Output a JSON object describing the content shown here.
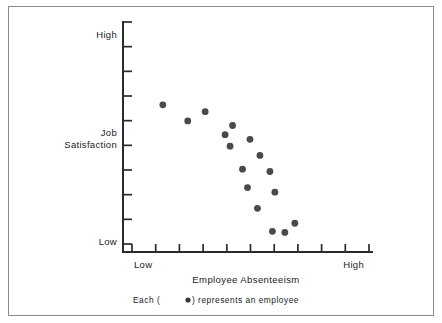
{
  "chart_data": {
    "type": "scatter",
    "title": "",
    "xlabel": "Employee Absenteeism",
    "ylabel": "Job Satisfaction",
    "xlim": [
      0,
      10
    ],
    "ylim": [
      0,
      10
    ],
    "grid": false,
    "legend": null,
    "x_tick_labels": {
      "low": "Low",
      "high": "High"
    },
    "y_tick_labels": {
      "low": "Low",
      "high": "High"
    },
    "x_tick_count": 11,
    "y_tick_count": 10,
    "caption": "Each ( ● ) represents an employee",
    "caption_prefix": "Each (",
    "caption_marker": "●",
    "caption_suffix": ") represents an employee",
    "point_count": 16,
    "points": [
      {
        "x": 1.6,
        "y": 6.4
      },
      {
        "x": 2.6,
        "y": 5.7
      },
      {
        "x": 3.3,
        "y": 6.1
      },
      {
        "x": 4.1,
        "y": 5.1
      },
      {
        "x": 4.4,
        "y": 5.5
      },
      {
        "x": 4.3,
        "y": 4.6
      },
      {
        "x": 5.1,
        "y": 4.9
      },
      {
        "x": 5.5,
        "y": 4.2
      },
      {
        "x": 4.8,
        "y": 3.6
      },
      {
        "x": 5.9,
        "y": 3.5
      },
      {
        "x": 5.0,
        "y": 2.8
      },
      {
        "x": 6.1,
        "y": 2.6
      },
      {
        "x": 5.4,
        "y": 1.9
      },
      {
        "x": 6.0,
        "y": 0.9
      },
      {
        "x": 6.5,
        "y": 0.85
      },
      {
        "x": 6.9,
        "y": 1.25
      }
    ]
  },
  "axes": {
    "y_axis": {
      "name": "Job Satisfaction",
      "label_line_1": "Job",
      "label_line_2": "Satisfaction",
      "high_label": "High",
      "low_label": "Low"
    },
    "x_axis": {
      "name": "Employee Absenteeism",
      "title": "Employee Absenteeism",
      "low_label": "Low",
      "high_label": "High"
    }
  },
  "colors": {
    "point": "#4a4a4a",
    "axis": "#2b2b2b",
    "frame": "#8a8a8a",
    "text": "#1a1a1a",
    "background": "#ffffff"
  }
}
